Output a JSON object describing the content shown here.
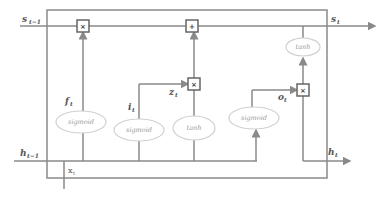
{
  "diagram": {
    "labels": {
      "s_prev": "s",
      "s_prev_sub": "t−1",
      "s_out": "s",
      "s_out_sub": "t",
      "h_prev": "h",
      "h_prev_sub": "t−1",
      "h_out": "h",
      "h_out_sub": "t",
      "x_in": "x",
      "x_in_sub": "t",
      "f": "f",
      "f_sub": "t",
      "i": "i",
      "i_sub": "t",
      "z": "z",
      "z_sub": "t",
      "o": "o",
      "o_sub": "t"
    },
    "operators": {
      "forget_mult": "×",
      "cell_add": "+",
      "input_mult": "×",
      "output_mult": "×"
    },
    "activations": {
      "forget_gate": "sigmoid",
      "input_gate": "sigmoid",
      "candidate": "tanh",
      "output_gate": "sigmoid",
      "cell_output": "tanh"
    },
    "colors": {
      "line": "#8a8a8a",
      "ellipse": "#d0d0d0",
      "text": "#555555"
    }
  }
}
